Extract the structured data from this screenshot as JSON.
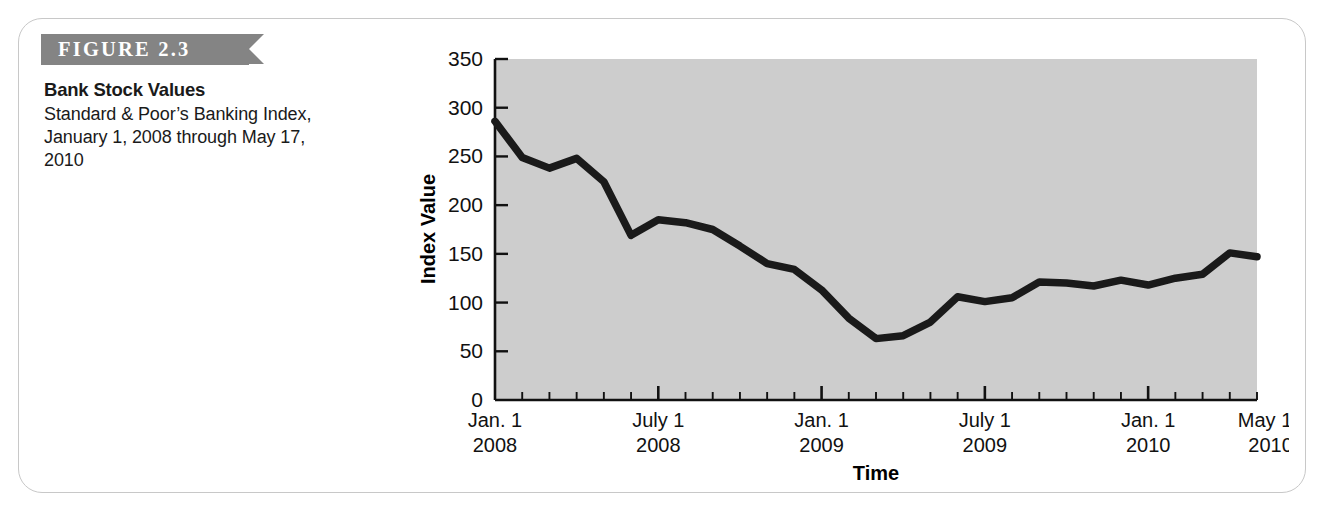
{
  "figure": {
    "banner_label": "FIGURE 2.3",
    "title": "Bank Stock Values",
    "subtitle": "Standard & Poor’s Banking Index, January 1, 2008 through May 17, 2010",
    "banner_color": "#848484",
    "plot_background_color": "#cdcdcd",
    "line_color": "#1a1a1a"
  },
  "chart_data": {
    "type": "line",
    "title": "Bank Stock Values",
    "subtitle": "Standard & Poor’s Banking Index, January 1, 2008 through May 17, 2010",
    "xlabel": "Time",
    "ylabel": "Index Value",
    "ylim": [
      0,
      350
    ],
    "yticks": [
      0,
      50,
      100,
      150,
      200,
      250,
      300,
      350
    ],
    "ytick_labels": [
      "0",
      "50",
      "100",
      "150",
      "200",
      "250",
      "300",
      "350"
    ],
    "grid": false,
    "legend": "none",
    "x_major_labels": [
      {
        "index": 0,
        "line1": "Jan. 1",
        "line2": "2008"
      },
      {
        "index": 6,
        "line1": "July 1",
        "line2": "2008"
      },
      {
        "index": 12,
        "line1": "Jan. 1",
        "line2": "2009"
      },
      {
        "index": 18,
        "line1": "July 1",
        "line2": "2009"
      },
      {
        "index": 24,
        "line1": "Jan. 1",
        "line2": "2010"
      },
      {
        "index": 28.5,
        "line1": "May 17",
        "line2": "2010"
      }
    ],
    "x_tick_count": 29,
    "x": [
      "Jan 2008",
      "Feb 2008",
      "Mar 2008",
      "Apr 2008",
      "May 2008",
      "Jun 2008",
      "Jul 2008",
      "Aug 2008",
      "Sep 2008",
      "Oct 2008",
      "Nov 2008",
      "Dec 2008",
      "Jan 2009",
      "Feb 2009",
      "Mar 2009",
      "Apr 2009",
      "May 2009",
      "Jun 2009",
      "Jul 2009",
      "Aug 2009",
      "Sep 2009",
      "Oct 2009",
      "Nov 2009",
      "Dec 2009",
      "Jan 2010",
      "Feb 2010",
      "Mar 2010",
      "Apr 2010",
      "May 17 2010"
    ],
    "series": [
      {
        "name": "Standard & Poor’s Banking Index",
        "values": [
          286,
          249,
          238,
          248,
          224,
          169,
          185,
          182,
          175,
          158,
          140,
          134,
          113,
          84,
          63,
          66,
          80,
          106,
          101,
          105,
          121,
          120,
          117,
          123,
          118,
          125,
          129,
          151,
          147
        ]
      }
    ]
  }
}
